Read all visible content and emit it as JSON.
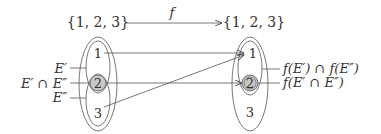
{
  "diagram": {
    "domain_set": "{1, 2, 3}",
    "codomain_set": "{1, 2, 3}",
    "map_label": "f",
    "left": {
      "elements": [
        "1",
        "2",
        "3"
      ],
      "labels": {
        "e_prime": "E′",
        "intersection": "E′ ∩ E″",
        "e_double_prime": "E″"
      }
    },
    "right": {
      "elements": [
        "1",
        "2",
        "3"
      ],
      "labels": {
        "image_intersection": "f(E′) ∩ f(E″)",
        "intersection_image": "f(E′ ∩ E″)"
      }
    },
    "mappings": [
      {
        "from": "1",
        "to": "1"
      },
      {
        "from": "2",
        "to": "2"
      },
      {
        "from": "3",
        "to": "1"
      }
    ],
    "colors": {
      "stroke": "#555555",
      "highlight_fill": "#c8c8c8"
    }
  }
}
